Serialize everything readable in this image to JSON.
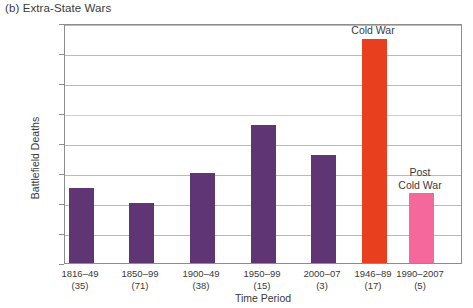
{
  "panel": {
    "title": "(b) Extra-State Wars"
  },
  "chart_data": {
    "type": "bar",
    "title": "(b) Extra-State Wars",
    "xlabel": "Time Period",
    "ylabel": "Battlefield Deaths",
    "ylim": [
      0,
      40000
    ],
    "ytick_values": [
      0,
      5000,
      10000,
      15000,
      20000,
      25000,
      30000,
      35000,
      40000
    ],
    "ytick_labels": [
      "0",
      "5,000",
      "10,000",
      "15,000",
      "20,000",
      "25,000",
      "30,000",
      "35,000",
      "40,000"
    ],
    "grid": true,
    "legend": "none",
    "categories": [
      "1816–49\n(35)",
      "1850–99\n(71)",
      "1900–49\n(38)",
      "1950–99\n(15)",
      "2000–07\n(3)",
      "1946–89\n(17)",
      "1990–2007\n(5)"
    ],
    "values": [
      12500,
      10000,
      15000,
      23000,
      18000,
      37400,
      11600
    ],
    "bars": [
      {
        "period": "1816–49",
        "count": "(35)",
        "value": 12500,
        "color": "#5f3673",
        "group": "time-period",
        "annotation": ""
      },
      {
        "period": "1850–99",
        "count": "(71)",
        "value": 10000,
        "color": "#5f3673",
        "group": "time-period",
        "annotation": ""
      },
      {
        "period": "1900–49",
        "count": "(38)",
        "value": 15000,
        "color": "#5f3673",
        "group": "time-period",
        "annotation": ""
      },
      {
        "period": "1950–99",
        "count": "(15)",
        "value": 23000,
        "color": "#5f3673",
        "group": "time-period",
        "annotation": ""
      },
      {
        "period": "2000–07",
        "count": "(3)",
        "value": 18000,
        "color": "#5f3673",
        "group": "time-period",
        "annotation": ""
      },
      {
        "period": "1946–89",
        "count": "(17)",
        "value": 37400,
        "color": "#e8401f",
        "group": "era",
        "annotation": "Cold War"
      },
      {
        "period": "1990–2007",
        "count": "(5)",
        "value": 11600,
        "color": "#f4689b",
        "group": "era",
        "annotation": "Post\nCold War"
      }
    ],
    "annotations": [
      {
        "text": "Cold War",
        "for": "1946–89"
      },
      {
        "text": "Post Cold War",
        "for": "1990–2007"
      }
    ]
  },
  "annotations": {
    "cold_war": "Cold War",
    "post_line1": "Post",
    "post_line2": "Cold War"
  },
  "colors": {
    "purple": "#5f3673",
    "red": "#e8401f",
    "pink": "#f4689b",
    "grid": "#b9b9c4",
    "axis": "#8d8d8d",
    "text": "#3a3a3a"
  }
}
